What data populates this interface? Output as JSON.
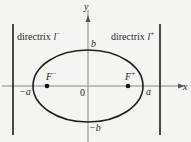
{
  "diagram": {
    "colors": {
      "background": "#f4f4f2",
      "stroke": "#1e1e1e",
      "axis": "#8a8a8a",
      "text": "#2a2a2a"
    },
    "axes": {
      "x_label": "x",
      "y_label": "y",
      "origin_label": "0"
    },
    "ellipse": {
      "cx": 88,
      "cy": 86,
      "a_px": 55,
      "b_px": 36
    },
    "vertices": {
      "left": "−a",
      "right": "a",
      "top": "b",
      "bottom": "−b"
    },
    "foci": [
      {
        "label_base": "F",
        "label_sup": "−",
        "x": 47
      },
      {
        "label_base": "F",
        "label_sup": "+",
        "x": 128
      }
    ],
    "directrices": [
      {
        "label_text": "directrix ",
        "label_var": "l",
        "label_sup": "−",
        "x": 13
      },
      {
        "label_text": "directrix ",
        "label_var": "l",
        "label_sup": "+",
        "x": 160
      }
    ]
  }
}
